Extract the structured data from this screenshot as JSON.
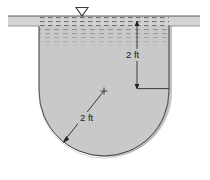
{
  "figure": {
    "caption": ""
  },
  "labels": {
    "depth_dimension": "2 ft",
    "radius_dimension": "2 ft"
  },
  "symbols": {
    "water_table": "water-table-triangle",
    "center_mark": "center-cross",
    "ground_surface": "ground-line"
  },
  "colors": {
    "tank_fill": "#c9c9c9",
    "ground_fill": "#d4d4d4",
    "outline": "#3c3c3c",
    "dimension_line": "#2a2a2a",
    "shadow": "#a9a9a9",
    "background": "#ffffff",
    "text": "#1a1a1a"
  },
  "geometry": {
    "ground_band": {
      "x": 8,
      "y": 16,
      "width": 192,
      "height": 10
    },
    "tank": {
      "left_wall_x": 39,
      "right_wall_x": 169,
      "top_y": 16,
      "straight_bottom_y": 91,
      "arc_center_x": 104,
      "arc_center_y": 91,
      "arc_radius": 65
    },
    "depth_dimension": {
      "x": 137,
      "top_y": 22,
      "bottom_y": 88,
      "leader_end_x": 169
    },
    "radius_arrow": {
      "from_x": 104,
      "from_y": 91,
      "to_x": 63,
      "to_y": 142
    },
    "water_triangle": {
      "left_x": 76,
      "right_x": 88,
      "apex_x": 82,
      "top_y": 7,
      "apex_y": 16
    }
  }
}
